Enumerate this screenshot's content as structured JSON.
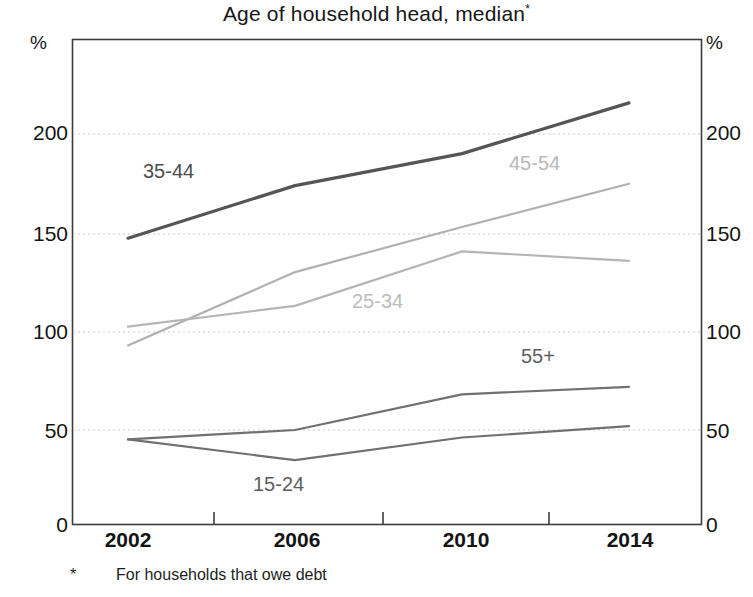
{
  "chart_data": {
    "type": "line",
    "title": "Age of household head, median",
    "title_superscript": "*",
    "footnote_marker": "*",
    "footnote": "For households that owe debt",
    "unit_label_left": "%",
    "unit_label_right": "%",
    "xlabel": "",
    "ylabel": "",
    "x": [
      2002,
      2006,
      2010,
      2014
    ],
    "xtick_labels": [
      "2002",
      "2006",
      "2010",
      "2014"
    ],
    "xlim": [
      2001,
      2015.4
    ],
    "ylim": [
      0,
      245
    ],
    "ytick_labels_left": [
      "0",
      "50",
      "100",
      "150",
      "200"
    ],
    "ytick_labels_right": [
      "0",
      "50",
      "100",
      "150",
      "200"
    ],
    "yticks": [
      0,
      50,
      100,
      150,
      200
    ],
    "grid": "horizontal dotted at 50, 100, 150, 200",
    "legend": "inline labels on plot",
    "series": [
      {
        "name": "35-44",
        "label": "35-44",
        "color": "#555555",
        "values": [
          152,
          180,
          197,
          224
        ]
      },
      {
        "name": "45-54",
        "label": "45-54",
        "color": "#b0b0b0",
        "values": [
          95,
          134,
          158,
          181
        ]
      },
      {
        "name": "25-34",
        "label": "25-34",
        "color": "#b5b5b5",
        "values": [
          105,
          116,
          145,
          140
        ]
      },
      {
        "name": "55+",
        "label": "55+",
        "color": "#707070",
        "values": [
          45,
          50,
          69,
          73
        ]
      },
      {
        "name": "15-24",
        "label": "15-24",
        "color": "#707070",
        "values": [
          45,
          34,
          46,
          52
        ]
      }
    ]
  }
}
